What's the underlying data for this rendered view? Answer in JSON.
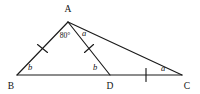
{
  "figure": {
    "background_color": "#ffffff",
    "stroke_color": "#1a1a1a",
    "text_color": "#111111"
  },
  "vertices": [
    {
      "name": "A",
      "label": "A",
      "x": 68,
      "y": 22,
      "label_x": 68,
      "label_y": 12
    },
    {
      "name": "B",
      "label": "B",
      "x": 17,
      "y": 75,
      "label_x": 11,
      "label_y": 88
    },
    {
      "name": "D",
      "label": "D",
      "x": 110,
      "y": 75,
      "label_x": 110,
      "label_y": 88
    },
    {
      "name": "C",
      "label": "C",
      "x": 182,
      "y": 75,
      "label_x": 186,
      "label_y": 88
    }
  ],
  "edges": [
    {
      "name": "segment-AB",
      "from": "A",
      "to": "B"
    },
    {
      "name": "segment-AD",
      "from": "A",
      "to": "D"
    },
    {
      "name": "segment-AC",
      "from": "A",
      "to": "C"
    },
    {
      "name": "segment-BC",
      "from": "B",
      "to": "C"
    }
  ],
  "angle_labels": [
    {
      "name": "angle-BAD",
      "text": "80°",
      "style": "numeric",
      "x": 65,
      "y": 38
    },
    {
      "name": "angle-DAC",
      "text": "a",
      "style": "italic",
      "x": 84,
      "y": 36
    },
    {
      "name": "angle-ABD",
      "text": "b",
      "style": "italic",
      "x": 30,
      "y": 69
    },
    {
      "name": "angle-ADB",
      "text": "b",
      "style": "italic",
      "x": 95,
      "y": 69
    },
    {
      "name": "angle-ACB",
      "text": "a",
      "style": "italic",
      "x": 163,
      "y": 70
    }
  ],
  "tick_marks": [
    {
      "name": "tick-segment-AB",
      "on_segment": "AB",
      "count": 1
    },
    {
      "name": "tick-segment-AD",
      "on_segment": "AD",
      "count": 1
    },
    {
      "name": "tick-segment-DC",
      "on_segment": "DC",
      "count": 1
    }
  ]
}
